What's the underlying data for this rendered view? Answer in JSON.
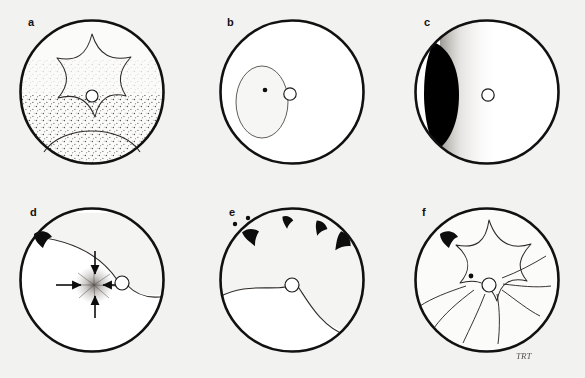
{
  "figure": {
    "background_color": "#f2f2f1",
    "ink_color": "#111111",
    "fundus_fill": "#fbfbfa",
    "detached_fill": "#ffffff",
    "attached_fill": "#f4f4f2",
    "rim_stroke_width": 2.6,
    "layout": {
      "columns": 3,
      "rows": 2,
      "panel_width": 195,
      "panel_height": 190
    },
    "signature": "TRT"
  },
  "panels": [
    {
      "id": "a",
      "letter": "a",
      "row": 1,
      "column": 1,
      "circle": {
        "cx": 92,
        "cy": 92,
        "r": 73
      },
      "optic_disc": {
        "cx": 92,
        "cy": 96,
        "r": 6
      },
      "features": [
        "star-folds",
        "pigment-stipple-inferior"
      ],
      "caption": "Star-shaped retinal folds radiating around the optic disc with inferior pigment stippling"
    },
    {
      "id": "b",
      "letter": "b",
      "row": 1,
      "column": 2,
      "circle": {
        "cx": 292,
        "cy": 92,
        "r": 73
      },
      "optic_disc": {
        "cx": 290,
        "cy": 94,
        "r": 6
      },
      "lesion_oval": {
        "cx": 262,
        "cy": 102,
        "rx": 26,
        "ry": 36
      },
      "macula_dot": {
        "cx": 265,
        "cy": 90,
        "r": 2.3
      },
      "features": [
        "localized-oval-detachment",
        "macula-dot"
      ],
      "caption": "Shallow localized oval detachment adjacent to the disc involving the macula"
    },
    {
      "id": "c",
      "letter": "c",
      "row": 1,
      "column": 3,
      "circle": {
        "cx": 487,
        "cy": 92,
        "r": 73
      },
      "optic_disc": {
        "cx": 488,
        "cy": 95,
        "r": 6
      },
      "mass": {
        "label": "pigmented-crescent-mass",
        "color": "#000000"
      },
      "features": [
        "black-crescent-mass-temporal",
        "gradient-shading"
      ],
      "caption": "Dark pigmented peripheral crescentic mass with adjacent graded shading"
    },
    {
      "id": "d",
      "letter": "d",
      "row": 2,
      "column": 1,
      "circle": {
        "cx": 92,
        "cy": 282,
        "r": 73
      },
      "optic_disc": {
        "cx": 122,
        "cy": 285,
        "r": 7
      },
      "tear_markers": [
        {
          "cx": 43,
          "cy": 243,
          "size": 13,
          "rotation": -25
        }
      ],
      "arrows": [
        {
          "direction": "down",
          "from": [
            95,
            255
          ],
          "to": [
            95,
            277
          ]
        },
        {
          "direction": "up",
          "from": [
            95,
            318
          ],
          "to": [
            95,
            296
          ]
        },
        {
          "direction": "right",
          "from": [
            58,
            287
          ],
          "to": [
            82,
            287
          ]
        },
        {
          "direction": "left",
          "from": [
            120,
            287
          ],
          "to": [
            101,
            287
          ]
        }
      ],
      "contraction_point": {
        "cx": 94,
        "cy": 287
      },
      "features": [
        "retinal-tear",
        "detachment-border",
        "convergent-traction-arrows",
        "starburst-contraction"
      ],
      "caption": "Retinal tear with surrounding detachment and converging arrows indicating tractional contraction"
    },
    {
      "id": "e",
      "letter": "e",
      "row": 2,
      "column": 2,
      "circle": {
        "cx": 292,
        "cy": 282,
        "r": 73
      },
      "optic_disc": {
        "cx": 292,
        "cy": 287,
        "r": 7
      },
      "tear_markers": [
        {
          "cx": 254,
          "cy": 238,
          "size": 9,
          "rotation": -20
        },
        {
          "cx": 289,
          "cy": 222,
          "size": 11,
          "rotation": 0
        },
        {
          "cx": 321,
          "cy": 229,
          "size": 12,
          "rotation": 22
        },
        {
          "cx": 343,
          "cy": 245,
          "size": 15,
          "rotation": 38
        }
      ],
      "small_dots": [
        {
          "cx": 235,
          "cy": 225,
          "r": 2.2
        },
        {
          "cx": 248,
          "cy": 219,
          "r": 2.2
        }
      ],
      "features": [
        "multiple-peripheral-tears",
        "small-holes",
        "bullous-detachment-border"
      ],
      "caption": "Multiple peripheral horseshoe tears and small holes with an inferior bullous detachment"
    },
    {
      "id": "f",
      "letter": "f",
      "row": 2,
      "column": 3,
      "circle": {
        "cx": 487,
        "cy": 282,
        "r": 73
      },
      "optic_disc": {
        "cx": 489,
        "cy": 287,
        "r": 7
      },
      "macula_dot": {
        "cx": 471,
        "cy": 278,
        "r": 2.4
      },
      "tear_markers": [
        {
          "cx": 447,
          "cy": 241,
          "size": 12,
          "rotation": -15
        }
      ],
      "features": [
        "fixed-star-folds",
        "radiating-retinal-folds",
        "heavy-inferior-pigment-clumping",
        "retinal-tear",
        "artist-signature"
      ],
      "caption": "Fixed star folds with radiating retinal folds and heavy inferior pigment clumping"
    }
  ]
}
